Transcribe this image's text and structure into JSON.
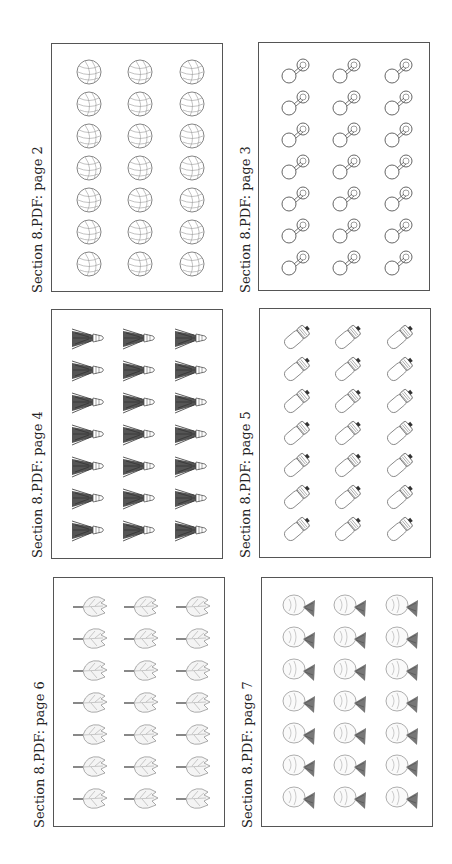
{
  "pages": [
    {
      "label": "Section 8.PDF: page 2",
      "icon": "globe-ball-icon",
      "frame": {
        "x": 51,
        "y": 43,
        "w": 172,
        "h": 249
      },
      "label_pos": {
        "x": 30,
        "y": 293
      }
    },
    {
      "label": "Section 8.PDF: page 3",
      "icon": "dumbbell-pin-icon",
      "frame": {
        "x": 258,
        "y": 42,
        "w": 172,
        "h": 249
      },
      "label_pos": {
        "x": 238,
        "y": 293
      }
    },
    {
      "label": "Section 8.PDF: page 4",
      "icon": "shuttlecock-icon",
      "frame": {
        "x": 51,
        "y": 309,
        "w": 172,
        "h": 250
      },
      "label_pos": {
        "x": 30,
        "y": 558
      }
    },
    {
      "label": "Section 8.PDF: page 5",
      "icon": "spray-can-icon",
      "frame": {
        "x": 259,
        "y": 308,
        "w": 172,
        "h": 250
      },
      "label_pos": {
        "x": 238,
        "y": 558
      }
    },
    {
      "label": "Section 8.PDF: page 6",
      "icon": "leaf-icon",
      "frame": {
        "x": 53,
        "y": 577,
        "w": 172,
        "h": 250
      },
      "label_pos": {
        "x": 32,
        "y": 828
      }
    },
    {
      "label": "Section 8.PDF: page 7",
      "icon": "fish-icon",
      "frame": {
        "x": 261,
        "y": 577,
        "w": 172,
        "h": 250
      },
      "label_pos": {
        "x": 240,
        "y": 828
      }
    }
  ],
  "grid": {
    "columns": 3,
    "rows": 7
  }
}
